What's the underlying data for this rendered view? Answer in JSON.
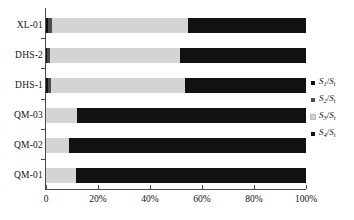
{
  "chart_data": {
    "type": "bar",
    "orientation": "horizontal",
    "stacked": true,
    "normalized": "percent",
    "title": "",
    "subtitle": "",
    "xlabel": "",
    "ylabel": "",
    "xlim": [
      0,
      100
    ],
    "grid": false,
    "legend_position": "right",
    "categories": [
      "QM-01",
      "QM-02",
      "QM-03",
      "DHS-1",
      "DHS-2",
      "XL-01"
    ],
    "categories_top_to_bottom": [
      "XL-01",
      "DHS-2",
      "DHS-1",
      "QM-03",
      "QM-02",
      "QM-01"
    ],
    "xtick_labels": [
      "0",
      "20%",
      "40%",
      "60%",
      "80%",
      "100%"
    ],
    "xtick_values": [
      0,
      20,
      40,
      60,
      80,
      100
    ],
    "series": [
      {
        "name": "S1/St",
        "legend_label": "S₁/Sₜ",
        "color": "#111111",
        "values": [
          0.0,
          0.0,
          0.0,
          0.6,
          0.5,
          0.6
        ]
      },
      {
        "name": "S2/St",
        "legend_label": "S₂/Sₜ",
        "color": "#4d4d4d",
        "values": [
          0.0,
          0.0,
          0.0,
          1.4,
          1.1,
          1.8
        ]
      },
      {
        "name": "S3/St",
        "legend_label": "S₃/Sₜ",
        "color": "#d4d4d4",
        "values": [
          11.5,
          9.0,
          12.0,
          51.5,
          50.0,
          52.4
        ]
      },
      {
        "name": "S4/St",
        "legend_label": "S₄/Sₜ",
        "color": "#111111",
        "values": [
          88.5,
          91.0,
          88.0,
          46.5,
          48.4,
          45.2
        ]
      }
    ]
  },
  "legend": {
    "items": [
      {
        "label": "S₁/Sₜ",
        "sym": "S",
        "sub": "1",
        "den_sub": "t",
        "color": "#111111"
      },
      {
        "label": "S₂/Sₜ",
        "sym": "S",
        "sub": "2",
        "den_sub": "t",
        "color": "#4d4d4d"
      },
      {
        "label": "S₃/Sₜ",
        "sym": "S",
        "sub": "3",
        "den_sub": "t",
        "color": "#d4d4d4"
      },
      {
        "label": "S₄/Sₜ",
        "sym": "S",
        "sub": "4",
        "den_sub": "t",
        "color": "#111111"
      }
    ]
  },
  "axis": {
    "x_labels": [
      "0",
      "20%",
      "40%",
      "60%",
      "80%",
      "100%"
    ],
    "y_labels": [
      "XL-01",
      "DHS-2",
      "DHS-1",
      "QM-03",
      "QM-02",
      "QM-01"
    ]
  },
  "colors": {
    "axis": "#4a4a4a",
    "text": "#111111",
    "s1": "#111111",
    "s2": "#4d4d4d",
    "s3": "#d4d4d4",
    "s4": "#111111",
    "background": "#ffffff"
  }
}
